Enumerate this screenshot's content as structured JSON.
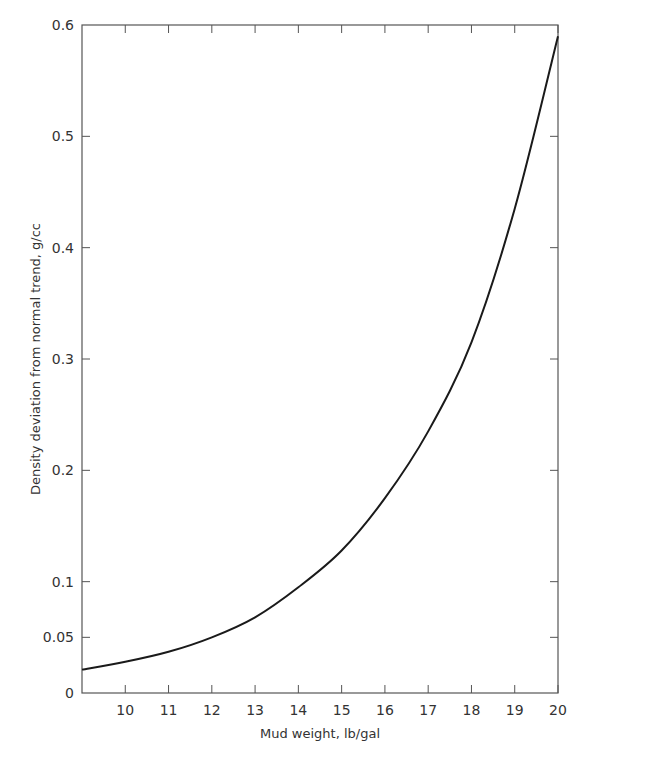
{
  "chart_data": {
    "type": "line",
    "title": "",
    "xlabel": "Mud weight, lb/gal",
    "ylabel": "Density deviation from normal trend, g/cc",
    "xlim": [
      9,
      20
    ],
    "ylim": [
      0,
      0.6
    ],
    "grid": false,
    "legend": null,
    "x_ticks": [
      10,
      11,
      12,
      13,
      14,
      15,
      16,
      17,
      18,
      19,
      20
    ],
    "x_tick_labels": [
      "10",
      "11",
      "12",
      "13",
      "14",
      "15",
      "16",
      "17",
      "18",
      "19",
      "20"
    ],
    "y_ticks": [
      0,
      0.05,
      0.1,
      0.2,
      0.3,
      0.4,
      0.5,
      0.6
    ],
    "y_tick_labels": [
      "0",
      "0.05",
      "0.1",
      "0.2",
      "0.3",
      "0.4",
      "0.5",
      "0.6"
    ],
    "series": [
      {
        "name": "density deviation",
        "color": "#1a1a1a",
        "x": [
          9,
          10,
          11,
          12,
          13,
          14,
          15,
          16,
          17,
          18,
          19,
          20
        ],
        "values": [
          0.021,
          0.028,
          0.037,
          0.05,
          0.068,
          0.095,
          0.128,
          0.175,
          0.235,
          0.315,
          0.435,
          0.59
        ]
      }
    ]
  },
  "colors": {
    "axis": "#555555",
    "curve": "#1a1a1a",
    "background": "#ffffff"
  }
}
